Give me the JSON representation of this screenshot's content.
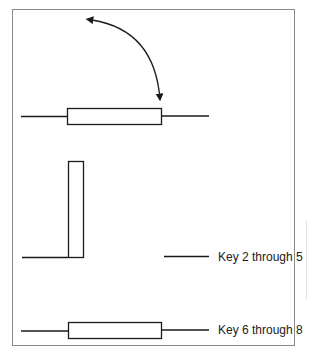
{
  "diagram": {
    "type": "switch-position-key",
    "colors": {
      "stroke": "#1a1a1a",
      "frame": "#8a8a8a",
      "background": "#ffffff"
    },
    "rotation_arrow": {
      "description": "double-headed curved arrow indicating rotation",
      "from": [
        90,
        20
      ],
      "to": [
        160,
        101
      ]
    },
    "rows": [
      {
        "id": "top",
        "orientation": "horizontal",
        "label": ""
      },
      {
        "id": "middle",
        "orientation": "vertical",
        "label": "Key 2 through 5"
      },
      {
        "id": "bottom",
        "orientation": "horizontal",
        "label": "Key 6 through 8"
      }
    ]
  }
}
